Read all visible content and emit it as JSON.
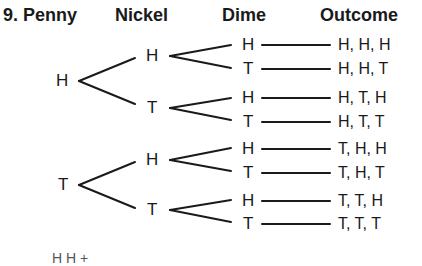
{
  "problem_number": "9.",
  "headers": {
    "penny": "Penny",
    "nickel": "Nickel",
    "dime": "Dime",
    "outcome": "Outcome"
  },
  "tree": {
    "penny": [
      "H",
      "T"
    ],
    "nickel": [
      "H",
      "T",
      "H",
      "T"
    ],
    "dime": [
      "H",
      "T",
      "H",
      "T",
      "H",
      "T",
      "H",
      "T"
    ]
  },
  "outcomes": [
    "H, H, H",
    "H, H, T",
    "H, T, H",
    "H, T, T",
    "T, H, H",
    "T, H, T",
    "T, T, H",
    "T, T, T"
  ],
  "footer_cut_text": "H  H  +"
}
